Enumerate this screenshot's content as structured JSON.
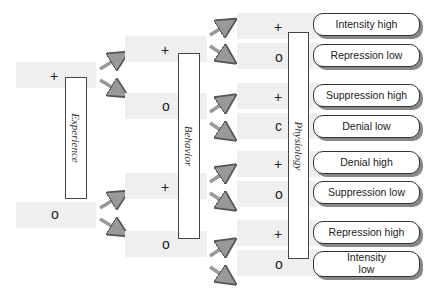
{
  "stages": [
    {
      "name": "Experience",
      "cells": [
        "+",
        "o"
      ]
    },
    {
      "name": "Behavior",
      "cells": [
        "+",
        "o",
        "+",
        "o"
      ]
    },
    {
      "name": "Physiology",
      "cells": [
        "+",
        "o",
        "+",
        "c",
        "+",
        "o",
        "+",
        "o"
      ]
    }
  ],
  "outcomes": [
    "Intensity high",
    "Repression low",
    "Suppression high",
    "Denial low",
    "Denial high",
    "Suppression low",
    "Repression high",
    "Intensity\nlow"
  ],
  "colors": {
    "cell": "#efefef",
    "arrow": "#999999",
    "border": "#333333"
  }
}
